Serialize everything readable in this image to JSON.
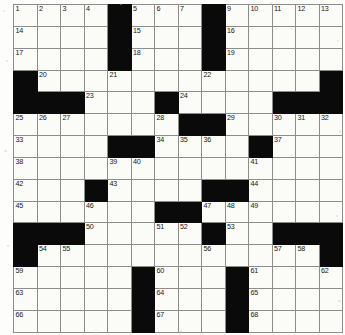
{
  "puzzle": {
    "type": "crossword-grid",
    "columns": 14,
    "rows": 15,
    "colors": {
      "block": "#0a0a0a",
      "cell": "#fbfbf8",
      "gridline": "#8d8d8d",
      "border": "#4a4a4a",
      "number": "#161616",
      "page": "#ffffff"
    },
    "legend": {
      "block_char": "#",
      "open_char": "."
    },
    "layout": [
      "....#....#.....",
      "....#....#.....",
      "....#....#.....",
      "#...........#",
      "###...#......###",
      "......##...###",
      "....##....#...",
      "..............",
      "...#.....##...",
      "...........#..",
      "###.....#.#.###",
      "#............#",
      ".....#...#...."
    ],
    "blocks": [
      [
        0,
        4
      ],
      [
        0,
        8
      ],
      [
        1,
        4
      ],
      [
        1,
        8
      ],
      [
        2,
        4
      ],
      [
        2,
        8
      ],
      [
        3,
        0
      ],
      [
        3,
        13
      ],
      [
        4,
        0
      ],
      [
        4,
        1
      ],
      [
        4,
        2
      ],
      [
        4,
        6
      ],
      [
        4,
        11
      ],
      [
        4,
        12
      ],
      [
        4,
        13
      ],
      [
        5,
        7
      ],
      [
        5,
        8
      ],
      [
        6,
        4
      ],
      [
        6,
        5
      ],
      [
        6,
        10
      ],
      [
        8,
        3
      ],
      [
        8,
        8
      ],
      [
        8,
        9
      ],
      [
        9,
        6
      ],
      [
        9,
        7
      ],
      [
        10,
        0
      ],
      [
        10,
        1
      ],
      [
        10,
        2
      ],
      [
        10,
        8
      ],
      [
        10,
        11
      ],
      [
        10,
        12
      ],
      [
        10,
        13
      ],
      [
        11,
        0
      ],
      [
        11,
        13
      ],
      [
        12,
        5
      ],
      [
        12,
        9
      ],
      [
        13,
        5
      ],
      [
        13,
        9
      ],
      [
        14,
        5
      ],
      [
        14,
        9
      ]
    ],
    "numbers": [
      {
        "row": 0,
        "col": 0,
        "n": "1"
      },
      {
        "row": 0,
        "col": 1,
        "n": "2"
      },
      {
        "row": 0,
        "col": 2,
        "n": "3"
      },
      {
        "row": 0,
        "col": 3,
        "n": "4"
      },
      {
        "row": 0,
        "col": 5,
        "n": "5"
      },
      {
        "row": 0,
        "col": 6,
        "n": "6"
      },
      {
        "row": 0,
        "col": 7,
        "n": "7"
      },
      {
        "row": 0,
        "col": 8,
        "n": "8"
      },
      {
        "row": 0,
        "col": 9,
        "n": "9"
      },
      {
        "row": 0,
        "col": 10,
        "n": "10"
      },
      {
        "row": 0,
        "col": 11,
        "n": "11"
      },
      {
        "row": 0,
        "col": 12,
        "n": "12"
      },
      {
        "row": 0,
        "col": 13,
        "n": "13"
      },
      {
        "row": 1,
        "col": 0,
        "n": "14"
      },
      {
        "row": 1,
        "col": 5,
        "n": "15"
      },
      {
        "row": 1,
        "col": 9,
        "n": "16"
      },
      {
        "row": 2,
        "col": 0,
        "n": "17"
      },
      {
        "row": 2,
        "col": 5,
        "n": "18"
      },
      {
        "row": 2,
        "col": 9,
        "n": "19"
      },
      {
        "row": 3,
        "col": 1,
        "n": "20"
      },
      {
        "row": 3,
        "col": 4,
        "n": "21"
      },
      {
        "row": 3,
        "col": 8,
        "n": "22"
      },
      {
        "row": 4,
        "col": 3,
        "n": "23"
      },
      {
        "row": 4,
        "col": 7,
        "n": "24"
      },
      {
        "row": 5,
        "col": 0,
        "n": "25"
      },
      {
        "row": 5,
        "col": 1,
        "n": "26"
      },
      {
        "row": 5,
        "col": 2,
        "n": "27"
      },
      {
        "row": 5,
        "col": 6,
        "n": "28"
      },
      {
        "row": 5,
        "col": 9,
        "n": "29"
      },
      {
        "row": 5,
        "col": 11,
        "n": "30"
      },
      {
        "row": 5,
        "col": 12,
        "n": "31"
      },
      {
        "row": 5,
        "col": 13,
        "n": "32"
      },
      {
        "row": 6,
        "col": 0,
        "n": "33"
      },
      {
        "row": 6,
        "col": 6,
        "n": "34"
      },
      {
        "row": 6,
        "col": 7,
        "n": "35"
      },
      {
        "row": 6,
        "col": 8,
        "n": "36"
      },
      {
        "row": 6,
        "col": 11,
        "n": "37"
      },
      {
        "row": 7,
        "col": 0,
        "n": "38"
      },
      {
        "row": 7,
        "col": 4,
        "n": "39"
      },
      {
        "row": 7,
        "col": 5,
        "n": "40"
      },
      {
        "row": 7,
        "col": 10,
        "n": "41"
      },
      {
        "row": 8,
        "col": 0,
        "n": "42"
      },
      {
        "row": 8,
        "col": 4,
        "n": "43"
      },
      {
        "row": 8,
        "col": 10,
        "n": "44"
      },
      {
        "row": 9,
        "col": 0,
        "n": "45"
      },
      {
        "row": 9,
        "col": 3,
        "n": "46"
      },
      {
        "row": 9,
        "col": 8,
        "n": "47"
      },
      {
        "row": 9,
        "col": 9,
        "n": "48"
      },
      {
        "row": 9,
        "col": 10,
        "n": "49"
      },
      {
        "row": 10,
        "col": 3,
        "n": "50"
      },
      {
        "row": 10,
        "col": 6,
        "n": "51"
      },
      {
        "row": 10,
        "col": 7,
        "n": "52"
      },
      {
        "row": 10,
        "col": 9,
        "n": "53"
      },
      {
        "row": 11,
        "col": 1,
        "n": "54"
      },
      {
        "row": 11,
        "col": 2,
        "n": "55"
      },
      {
        "row": 11,
        "col": 8,
        "n": "56"
      },
      {
        "row": 11,
        "col": 11,
        "n": "57"
      },
      {
        "row": 11,
        "col": 12,
        "n": "58"
      },
      {
        "row": 12,
        "col": 0,
        "n": "59"
      },
      {
        "row": 12,
        "col": 6,
        "n": "60"
      },
      {
        "row": 12,
        "col": 10,
        "n": "61"
      },
      {
        "row": 12,
        "col": 13,
        "n": "62"
      },
      {
        "row": 13,
        "col": 0,
        "n": "63"
      },
      {
        "row": 13,
        "col": 6,
        "n": "64"
      },
      {
        "row": 13,
        "col": 10,
        "n": "65"
      },
      {
        "row": 14,
        "col": 0,
        "n": "66"
      },
      {
        "row": 14,
        "col": 6,
        "n": "67"
      },
      {
        "row": 14,
        "col": 10,
        "n": "68"
      }
    ],
    "entries": []
  }
}
